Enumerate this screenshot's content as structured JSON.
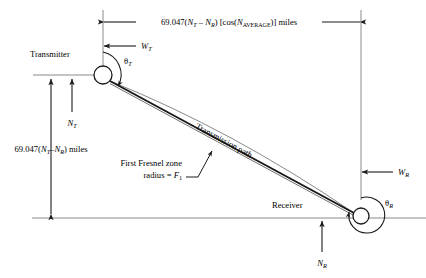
{
  "figure": {
    "kind": "engineering-diagram",
    "background_color": "#ffffff",
    "line_color": "#1a1a1a",
    "thin_line_color": "#6e6e6e"
  },
  "labels": {
    "transmitter": "Transmitter",
    "receiver": "Receiver",
    "transmission_path": "Transmission path",
    "fresnel_line1": "First Fresnel zone",
    "fresnel_line2_prefix": "radius = ",
    "fresnel_line2_symbol": "F",
    "fresnel_line2_sub": "1"
  },
  "dimensions": {
    "horizontal": {
      "coefficient": "69.047(",
      "n_t": "N",
      "n_t_sub": "T",
      "minus": " – ",
      "n_r": "N",
      "n_r_sub": "R",
      "close_paren": ") [cos(",
      "n_avg": "N",
      "n_avg_sub": "AVERAGE",
      "tail": ")] miles",
      "full_text": "69.047(NT – NR) [cos(NAVERAGE)] miles"
    },
    "vertical": {
      "coefficient": "69.047(",
      "n_t": "N",
      "n_t_sub": "T",
      "minus": "–",
      "n_r": "N",
      "n_r_sub": "R",
      "tail": ") miles",
      "full_text": "69.047(NT–NR) miles"
    }
  },
  "variables": {
    "w_t": {
      "symbol": "W",
      "sub": "T"
    },
    "w_r": {
      "symbol": "W",
      "sub": "R"
    },
    "n_t": {
      "symbol": "N",
      "sub": "T"
    },
    "n_r": {
      "symbol": "N",
      "sub": "R"
    },
    "theta_t": {
      "symbol": "θ",
      "sub": "T"
    },
    "theta_r": {
      "symbol": "θ",
      "sub": "R"
    }
  },
  "geometry": {
    "transmitter_center": {
      "x": 103,
      "y": 75
    },
    "transmitter_radius": 9,
    "receiver_center": {
      "x": 361,
      "y": 216
    },
    "receiver_radius": 8,
    "theta_r_arc_radius": 18,
    "baseline_y": 218,
    "top_dim_y": 22,
    "wt_dim_y": 46,
    "left_vertical_x": 103,
    "right_vertical_x": 361
  }
}
